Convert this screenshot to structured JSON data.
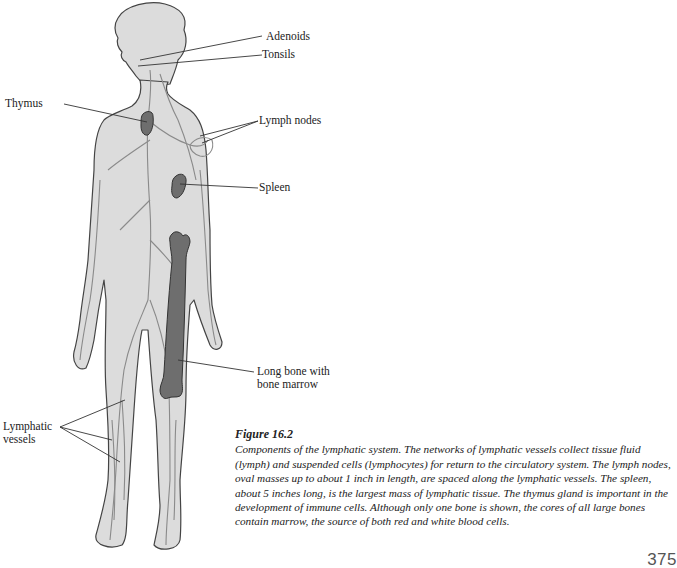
{
  "figure": {
    "labels": {
      "adenoids": "Adenoids",
      "tonsils": "Tonsils",
      "thymus": "Thymus",
      "lymph_nodes": "Lymph nodes",
      "spleen": "Spleen",
      "long_bone_line1": "Long bone with",
      "long_bone_line2": "bone marrow",
      "lymphatic_vessels_line1": "Lymphatic",
      "lymphatic_vessels_line2": "vessels"
    },
    "colors": {
      "body_fill": "#d9d9d9",
      "outline": "#444444",
      "vessel": "#8a8a8a",
      "organ_fill": "#6e6e6e"
    }
  },
  "caption": {
    "title": "Figure 16.2",
    "text": "Components of the lymphatic system. The networks of lymphatic vessels collect tissue fluid (lymph) and suspended cells (lymphocytes) for return to the circulatory system. The lymph nodes, oval masses up to about 1 inch in length, are spaced along the lymphatic vessels. The spleen, about 5 inches long, is the largest mass of lymphatic tissue. The thymus gland is important in the development of immune cells. Although only one bone is shown, the cores of all large bones contain marrow, the source of both red and white blood cells."
  },
  "page_number": "375"
}
